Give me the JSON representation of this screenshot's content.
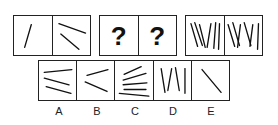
{
  "question_row": {
    "group1": {
      "cells": [
        "single-diagonal-line",
        "two-lines"
      ]
    },
    "group2": {
      "cells": [
        "?",
        "?"
      ]
    },
    "group3": {
      "cells": [
        "six-slanted-lines",
        "six-slanted-lines"
      ]
    }
  },
  "options": [
    {
      "label": "A",
      "figure": "three-horizontal-lines"
    },
    {
      "label": "B",
      "figure": "two-lines-angle"
    },
    {
      "label": "C",
      "figure": "five-lines"
    },
    {
      "label": "D",
      "figure": "four-vertical-lines"
    },
    {
      "label": "E",
      "figure": "single-diagonal-line"
    }
  ]
}
